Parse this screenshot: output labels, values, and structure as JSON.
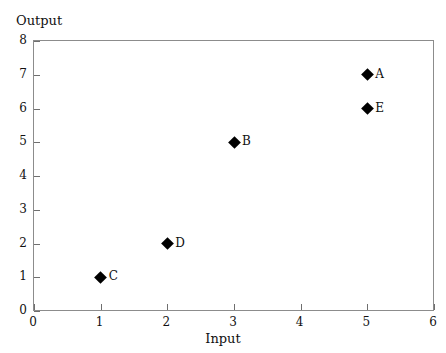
{
  "chart_data": {
    "type": "scatter",
    "title": "",
    "xlabel": "Input",
    "ylabel": "Output",
    "xlim": [
      0,
      6
    ],
    "ylim": [
      0,
      8
    ],
    "xticks": [
      "0",
      "1",
      "2",
      "3",
      "4",
      "5",
      "6"
    ],
    "yticks": [
      "0",
      "1",
      "2",
      "3",
      "4",
      "5",
      "6",
      "7",
      "8"
    ],
    "grid": false,
    "legend": false,
    "marker": "filled-diamond",
    "marker_color": "#000000",
    "frame_color": "#8c8c8c",
    "background": "#ffffff",
    "points": [
      {
        "label": "A",
        "x": 5,
        "y": 7
      },
      {
        "label": "E",
        "x": 5,
        "y": 6
      },
      {
        "label": "B",
        "x": 3,
        "y": 5
      },
      {
        "label": "D",
        "x": 2,
        "y": 2
      },
      {
        "label": "C",
        "x": 1,
        "y": 1
      }
    ]
  }
}
